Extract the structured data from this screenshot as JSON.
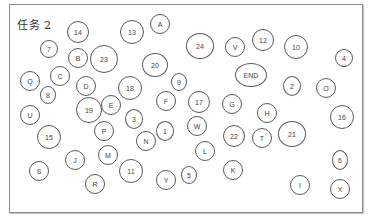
{
  "title": "任务 2",
  "nodes": [
    {
      "label": "14",
      "x": 78,
      "y": 32,
      "rx": 11,
      "ry": 11
    },
    {
      "label": "13",
      "x": 132,
      "y": 32,
      "rx": 12,
      "ry": 12
    },
    {
      "label": "A",
      "x": 160,
      "y": 24,
      "rx": 10,
      "ry": 10
    },
    {
      "label": "24",
      "x": 200,
      "y": 46,
      "rx": 14,
      "ry": 13
    },
    {
      "label": "V",
      "x": 235,
      "y": 47,
      "rx": 10,
      "ry": 10
    },
    {
      "label": "12",
      "x": 263,
      "y": 40,
      "rx": 11,
      "ry": 11
    },
    {
      "label": "10",
      "x": 296,
      "y": 47,
      "rx": 12,
      "ry": 12
    },
    {
      "label": "4",
      "x": 344,
      "y": 58,
      "rx": 9,
      "ry": 9
    },
    {
      "label": "7",
      "x": 49,
      "y": 49,
      "rx": 9,
      "ry": 9
    },
    {
      "label": "B",
      "x": 78,
      "y": 58,
      "rx": 10,
      "ry": 10
    },
    {
      "label": "23",
      "x": 104,
      "y": 59,
      "rx": 14,
      "ry": 14
    },
    {
      "label": "20",
      "x": 155,
      "y": 65,
      "rx": 13,
      "ry": 12
    },
    {
      "label": "END",
      "x": 251,
      "y": 75,
      "rx": 16,
      "ry": 12
    },
    {
      "label": "9",
      "x": 179,
      "y": 82,
      "rx": 8,
      "ry": 9
    },
    {
      "label": "Q",
      "x": 30,
      "y": 81,
      "rx": 10,
      "ry": 10
    },
    {
      "label": "C",
      "x": 60,
      "y": 76,
      "rx": 10,
      "ry": 10
    },
    {
      "label": "D",
      "x": 86,
      "y": 86,
      "rx": 10,
      "ry": 10
    },
    {
      "label": "18",
      "x": 130,
      "y": 88,
      "rx": 12,
      "ry": 12
    },
    {
      "label": "8",
      "x": 48,
      "y": 95,
      "rx": 8,
      "ry": 9
    },
    {
      "label": "2",
      "x": 292,
      "y": 86,
      "rx": 9,
      "ry": 10
    },
    {
      "label": "O",
      "x": 326,
      "y": 88,
      "rx": 10,
      "ry": 10
    },
    {
      "label": "19",
      "x": 89,
      "y": 110,
      "rx": 13,
      "ry": 13
    },
    {
      "label": "E",
      "x": 111,
      "y": 105,
      "rx": 10,
      "ry": 10
    },
    {
      "label": "F",
      "x": 166,
      "y": 101,
      "rx": 10,
      "ry": 10
    },
    {
      "label": "17",
      "x": 199,
      "y": 102,
      "rx": 11,
      "ry": 11
    },
    {
      "label": "G",
      "x": 232,
      "y": 104,
      "rx": 10,
      "ry": 10
    },
    {
      "label": "U",
      "x": 30,
      "y": 115,
      "rx": 10,
      "ry": 10
    },
    {
      "label": "H",
      "x": 267,
      "y": 113,
      "rx": 10,
      "ry": 10
    },
    {
      "label": "16",
      "x": 342,
      "y": 117,
      "rx": 12,
      "ry": 12
    },
    {
      "label": "3",
      "x": 134,
      "y": 119,
      "rx": 9,
      "ry": 10
    },
    {
      "label": "P",
      "x": 104,
      "y": 131,
      "rx": 10,
      "ry": 10
    },
    {
      "label": "W",
      "x": 197,
      "y": 126,
      "rx": 10,
      "ry": 10
    },
    {
      "label": "1",
      "x": 165,
      "y": 131,
      "rx": 9,
      "ry": 10
    },
    {
      "label": "15",
      "x": 49,
      "y": 137,
      "rx": 12,
      "ry": 12
    },
    {
      "label": "22",
      "x": 234,
      "y": 136,
      "rx": 11,
      "ry": 11
    },
    {
      "label": "T",
      "x": 262,
      "y": 138,
      "rx": 10,
      "ry": 10
    },
    {
      "label": "21",
      "x": 292,
      "y": 134,
      "rx": 14,
      "ry": 13
    },
    {
      "label": "N",
      "x": 146,
      "y": 141,
      "rx": 10,
      "ry": 10
    },
    {
      "label": "L",
      "x": 205,
      "y": 151,
      "rx": 10,
      "ry": 10
    },
    {
      "label": "M",
      "x": 108,
      "y": 155,
      "rx": 10,
      "ry": 10
    },
    {
      "label": "J",
      "x": 75,
      "y": 160,
      "rx": 10,
      "ry": 10
    },
    {
      "label": "6",
      "x": 340,
      "y": 160,
      "rx": 8,
      "ry": 10
    },
    {
      "label": "11",
      "x": 131,
      "y": 171,
      "rx": 12,
      "ry": 12
    },
    {
      "label": "S",
      "x": 39,
      "y": 171,
      "rx": 10,
      "ry": 10
    },
    {
      "label": "K",
      "x": 233,
      "y": 170,
      "rx": 10,
      "ry": 10
    },
    {
      "label": "5",
      "x": 189,
      "y": 175,
      "rx": 8,
      "ry": 9
    },
    {
      "label": "Y",
      "x": 166,
      "y": 180,
      "rx": 10,
      "ry": 10
    },
    {
      "label": "I",
      "x": 300,
      "y": 185,
      "rx": 10,
      "ry": 10
    },
    {
      "label": "X",
      "x": 340,
      "y": 189,
      "rx": 10,
      "ry": 10
    },
    {
      "label": "R",
      "x": 95,
      "y": 184,
      "rx": 10,
      "ry": 10
    }
  ]
}
